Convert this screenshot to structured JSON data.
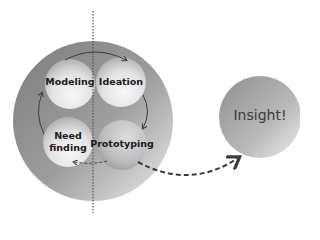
{
  "diagram": {
    "cycle_stages": [
      {
        "label": "Modeling",
        "x": 70,
        "y": 84
      },
      {
        "label": "Ideation",
        "x": 121,
        "y": 82
      },
      {
        "label": "Prototyping",
        "x": 122,
        "y": 145
      },
      {
        "label": "Need\nfinding",
        "x": 68,
        "y": 142
      }
    ],
    "outcome": {
      "label": "Insight!"
    },
    "colors": {
      "outer_circle_dark": "#7a7a7a",
      "outer_circle_light": "#e4e4e4",
      "arrow": "#3c3c3c",
      "text": "#1a1a1a"
    }
  }
}
